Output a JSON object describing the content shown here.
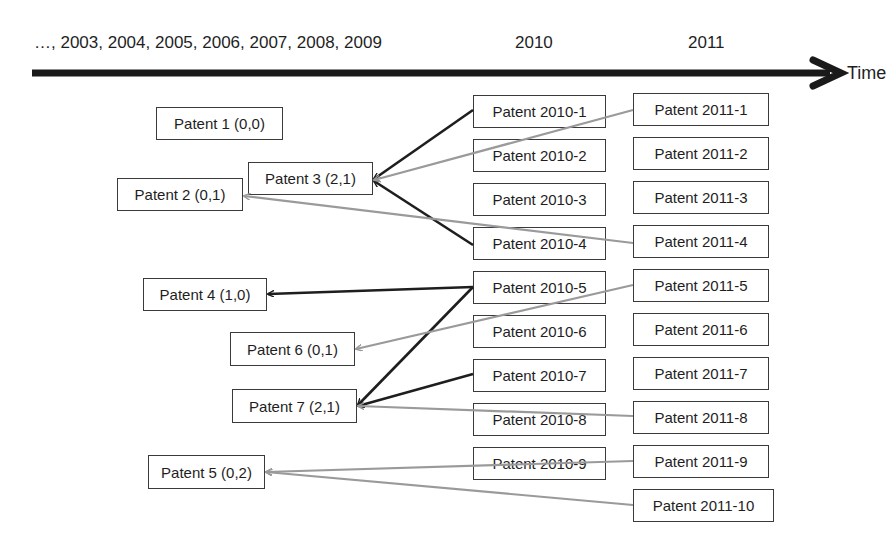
{
  "timeline": {
    "early_years_label": "…, 2003, 2004, 2005, 2006, 2007, 2008, 2009",
    "year_2010_label": "2010",
    "year_2011_label": "2011",
    "axis_label": "Time"
  },
  "colors": {
    "axis": "#1a1a1a",
    "strong_link": "#1e1e1e",
    "weak_link": "#9a9a9a",
    "box_border": "#3a3a3a"
  },
  "prior_patents": [
    {
      "id": "p1",
      "label": "Patent 1 (0,0)",
      "x": 156,
      "y": 107,
      "w": 127,
      "h": 33
    },
    {
      "id": "p3",
      "label": "Patent 3 (2,1)",
      "x": 248,
      "y": 162,
      "w": 125,
      "h": 33
    },
    {
      "id": "p2",
      "label": "Patent 2 (0,1)",
      "x": 117,
      "y": 178,
      "w": 126,
      "h": 33
    },
    {
      "id": "p4",
      "label": "Patent 4 (1,0)",
      "x": 143,
      "y": 278,
      "w": 124,
      "h": 33
    },
    {
      "id": "p6",
      "label": "Patent 6 (0,1)",
      "x": 230,
      "y": 332,
      "w": 125,
      "h": 34
    },
    {
      "id": "p7",
      "label": "Patent 7 (2,1)",
      "x": 232,
      "y": 389,
      "w": 125,
      "h": 34
    },
    {
      "id": "p5",
      "label": "Patent 5 (0,2)",
      "x": 148,
      "y": 455,
      "w": 117,
      "h": 34
    }
  ],
  "patents_2010": [
    {
      "id": "a1",
      "label": "Patent 2010-1",
      "x": 473,
      "y": 95,
      "w": 133,
      "h": 33
    },
    {
      "id": "a2",
      "label": "Patent 2010-2",
      "x": 473,
      "y": 139,
      "w": 133,
      "h": 33
    },
    {
      "id": "a3",
      "label": "Patent 2010-3",
      "x": 473,
      "y": 183,
      "w": 133,
      "h": 33
    },
    {
      "id": "a4",
      "label": "Patent 2010-4",
      "x": 473,
      "y": 227,
      "w": 133,
      "h": 33
    },
    {
      "id": "a5",
      "label": "Patent 2010-5",
      "x": 473,
      "y": 271,
      "w": 133,
      "h": 33
    },
    {
      "id": "a6",
      "label": "Patent 2010-6",
      "x": 473,
      "y": 315,
      "w": 133,
      "h": 33
    },
    {
      "id": "a7",
      "label": "Patent 2010-7",
      "x": 473,
      "y": 359,
      "w": 133,
      "h": 33
    },
    {
      "id": "a8",
      "label": "Patent 2010-8",
      "x": 473,
      "y": 403,
      "w": 133,
      "h": 33
    },
    {
      "id": "a9",
      "label": "Patent 2010-9",
      "x": 473,
      "y": 447,
      "w": 133,
      "h": 33
    }
  ],
  "patents_2011": [
    {
      "id": "b1",
      "label": "Patent 2011-1",
      "x": 633,
      "y": 93,
      "w": 136,
      "h": 33
    },
    {
      "id": "b2",
      "label": "Patent 2011-2",
      "x": 633,
      "y": 137,
      "w": 136,
      "h": 33
    },
    {
      "id": "b3",
      "label": "Patent 2011-3",
      "x": 633,
      "y": 181,
      "w": 136,
      "h": 33
    },
    {
      "id": "b4",
      "label": "Patent 2011-4",
      "x": 633,
      "y": 225,
      "w": 136,
      "h": 33
    },
    {
      "id": "b5",
      "label": "Patent 2011-5",
      "x": 633,
      "y": 269,
      "w": 136,
      "h": 33
    },
    {
      "id": "b6",
      "label": "Patent 2011-6",
      "x": 633,
      "y": 313,
      "w": 136,
      "h": 33
    },
    {
      "id": "b7",
      "label": "Patent 2011-7",
      "x": 633,
      "y": 357,
      "w": 136,
      "h": 33
    },
    {
      "id": "b8",
      "label": "Patent 2011-8",
      "x": 633,
      "y": 401,
      "w": 136,
      "h": 33
    },
    {
      "id": "b9",
      "label": "Patent 2011-9",
      "x": 633,
      "y": 445,
      "w": 136,
      "h": 33
    },
    {
      "id": "b10",
      "label": "Patent 2011-10",
      "x": 633,
      "y": 489,
      "w": 141,
      "h": 33
    }
  ],
  "citations": [
    {
      "from": "Patent 2010-1",
      "to": "Patent 3 (2,1)",
      "type": "strong",
      "x1": 473,
      "y1": 110,
      "x2": 374,
      "y2": 179
    },
    {
      "from": "Patent 2010-4",
      "to": "Patent 3 (2,1)",
      "type": "strong",
      "x1": 473,
      "y1": 245,
      "x2": 374,
      "y2": 181
    },
    {
      "from": "Patent 2011-1",
      "to": "Patent 3 (2,1)",
      "type": "weak",
      "x1": 633,
      "y1": 110,
      "x2": 374,
      "y2": 180
    },
    {
      "from": "Patent 2011-4",
      "to": "Patent 2 (0,1)",
      "type": "weak",
      "x1": 633,
      "y1": 243,
      "x2": 244,
      "y2": 196
    },
    {
      "from": "Patent 2010-5",
      "to": "Patent 4 (1,0)",
      "type": "strong",
      "x1": 473,
      "y1": 287,
      "x2": 268,
      "y2": 294
    },
    {
      "from": "Patent 2010-5",
      "to": "Patent 7 (2,1)",
      "type": "strong",
      "x1": 473,
      "y1": 287,
      "x2": 358,
      "y2": 405
    },
    {
      "from": "Patent 2011-5",
      "to": "Patent 6 (0,1)",
      "type": "weak",
      "x1": 633,
      "y1": 285,
      "x2": 356,
      "y2": 349
    },
    {
      "from": "Patent 2010-7",
      "to": "Patent 7 (2,1)",
      "type": "strong",
      "x1": 473,
      "y1": 374,
      "x2": 358,
      "y2": 406
    },
    {
      "from": "Patent 2011-8",
      "to": "Patent 7 (2,1)",
      "type": "weak",
      "x1": 633,
      "y1": 416,
      "x2": 358,
      "y2": 406
    },
    {
      "from": "Patent 2011-9",
      "to": "Patent 5 (0,2)",
      "type": "weak",
      "x1": 633,
      "y1": 461,
      "x2": 266,
      "y2": 472
    },
    {
      "from": "Patent 2011-10",
      "to": "Patent 5 (0,2)",
      "type": "weak",
      "x1": 633,
      "y1": 505,
      "x2": 266,
      "y2": 472
    }
  ]
}
